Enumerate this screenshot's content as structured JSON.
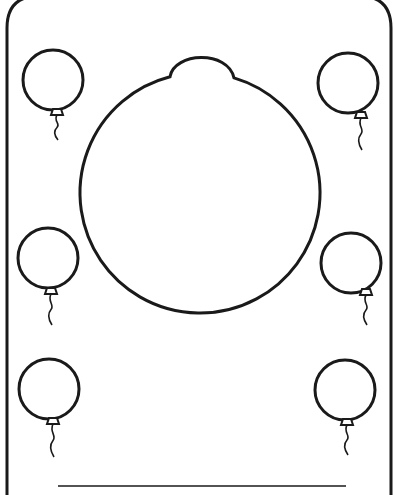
{
  "page": {
    "type": "balloon-frame-coloring-page",
    "stroke_color": "#1a1a1a",
    "background_color": "#ffffff"
  },
  "frame": {
    "left_x": 7,
    "right_x": 391,
    "corner_radius": 32
  },
  "center_balloon": {
    "cx": 200,
    "cy": 193,
    "r": 120,
    "knot_top_y": 56,
    "knot_left_x": 170,
    "knot_right_x": 234
  },
  "small_balloons": [
    {
      "id": "top-left",
      "cx": 53,
      "cy": 80,
      "r": 30,
      "knot_x": 57,
      "knot_y": 112,
      "string_end_y": 140
    },
    {
      "id": "top-right",
      "cx": 348,
      "cy": 83,
      "r": 30,
      "knot_x": 361,
      "knot_y": 115,
      "string_end_y": 150
    },
    {
      "id": "middle-left",
      "cx": 48,
      "cy": 258,
      "r": 30,
      "knot_x": 51,
      "knot_y": 291,
      "string_end_y": 325
    },
    {
      "id": "middle-right",
      "cx": 351,
      "cy": 263,
      "r": 30,
      "knot_x": 366,
      "knot_y": 292,
      "string_end_y": 325
    },
    {
      "id": "bottom-left",
      "cx": 49,
      "cy": 389,
      "r": 30,
      "knot_x": 53,
      "knot_y": 421,
      "string_end_y": 457
    },
    {
      "id": "bottom-right",
      "cx": 345,
      "cy": 390,
      "r": 30,
      "knot_x": 347,
      "knot_y": 422,
      "string_end_y": 455
    }
  ],
  "name_line": {
    "x1": 58,
    "x2": 346,
    "y": 486,
    "text": ""
  }
}
